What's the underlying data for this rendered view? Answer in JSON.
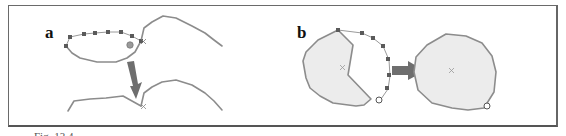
{
  "figure": {
    "panels": [
      {
        "id": "a",
        "label": "a",
        "description": "open curve with dotted polyline extension being merged; down arrow shows result of joining curves at cross mark"
      },
      {
        "id": "b",
        "label": "b",
        "description": "filled polygon extended by dotted arc; right arrow shows resulting rounded polygon"
      }
    ],
    "caption": {
      "visible": "partially clipped",
      "text": "Fig. 13.4."
    }
  },
  "colors": {
    "stroke": "#8c8c8c",
    "fill": "#ececec",
    "marker": "#5a5a5a",
    "arrow": "#6e6e6e",
    "frame": "#6a6a6a"
  }
}
